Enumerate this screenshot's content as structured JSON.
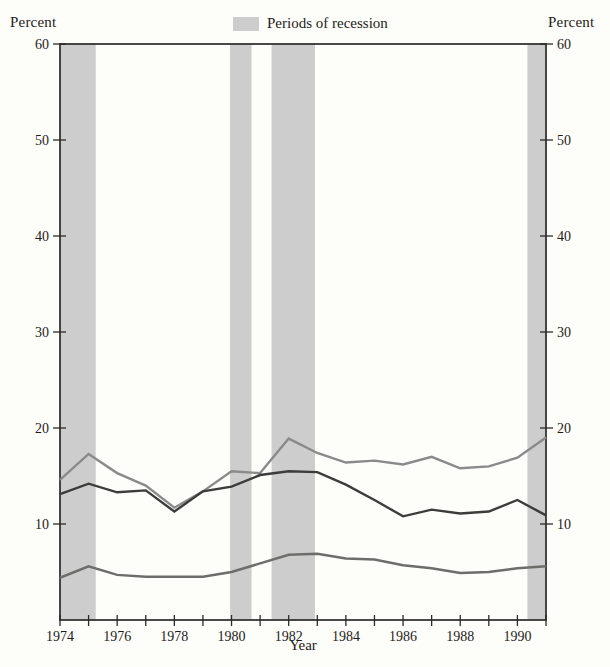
{
  "header": {
    "left_axis_title": "Percent",
    "right_axis_title": "Percent",
    "legend": {
      "label": "Periods of recession",
      "swatch_color": "#cdcdcd"
    }
  },
  "x_axis": {
    "title": "Year",
    "labeled_years": [
      1974,
      1976,
      1978,
      1980,
      1982,
      1984,
      1986,
      1988,
      1990
    ],
    "minor_tick_every_year": true
  },
  "y_axis": {
    "ticks": [
      10,
      20,
      30,
      40,
      50,
      60
    ],
    "shown_on_both_sides": true
  },
  "colors": {
    "background": "#fdfdfa",
    "axis": "#2c2a27",
    "band": "#cdcdcd",
    "text": "#1e1c19"
  },
  "chart_data": {
    "type": "line",
    "title": "",
    "xlabel": "Year",
    "ylabel": "Percent",
    "xlim": [
      1974,
      1991
    ],
    "ylim": [
      0,
      60
    ],
    "grid": false,
    "legend_position": "top-center",
    "x": [
      1974,
      1975,
      1976,
      1977,
      1978,
      1979,
      1980,
      1981,
      1982,
      1983,
      1984,
      1985,
      1986,
      1987,
      1988,
      1989,
      1990,
      1991
    ],
    "series": [
      {
        "name": "upper-gray-line",
        "color": "#8a8a8a",
        "stroke_width": 2.4,
        "values": [
          14.6,
          17.3,
          15.3,
          14.0,
          11.7,
          13.4,
          15.5,
          15.3,
          18.9,
          17.4,
          16.4,
          16.6,
          16.2,
          17.0,
          15.8,
          16.0,
          16.9,
          19.0
        ]
      },
      {
        "name": "dark-line",
        "color": "#3d3c3a",
        "stroke_width": 2.4,
        "values": [
          13.1,
          14.2,
          13.3,
          13.5,
          11.3,
          13.4,
          13.9,
          15.1,
          15.5,
          15.4,
          14.1,
          12.5,
          10.8,
          11.5,
          11.1,
          11.3,
          12.5,
          10.9
        ]
      },
      {
        "name": "lower-gray-line",
        "color": "#6e6d6b",
        "stroke_width": 2.5,
        "values": [
          4.4,
          5.6,
          4.7,
          4.5,
          4.5,
          4.5,
          5.0,
          5.9,
          6.8,
          6.9,
          6.4,
          6.3,
          5.7,
          5.4,
          4.9,
          5.0,
          5.4,
          5.6
        ]
      }
    ],
    "recession_bands": [
      [
        1974.0,
        1975.25
      ],
      [
        1979.95,
        1980.7
      ],
      [
        1981.4,
        1982.92
      ],
      [
        1990.35,
        1991.0
      ]
    ]
  }
}
